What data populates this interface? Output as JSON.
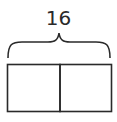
{
  "diagram": {
    "type": "tape-diagram",
    "total_label": "16",
    "parts": [
      {
        "label": ""
      },
      {
        "label": ""
      }
    ],
    "colors": {
      "stroke": "#2a2a2a",
      "background": "#ffffff"
    }
  }
}
